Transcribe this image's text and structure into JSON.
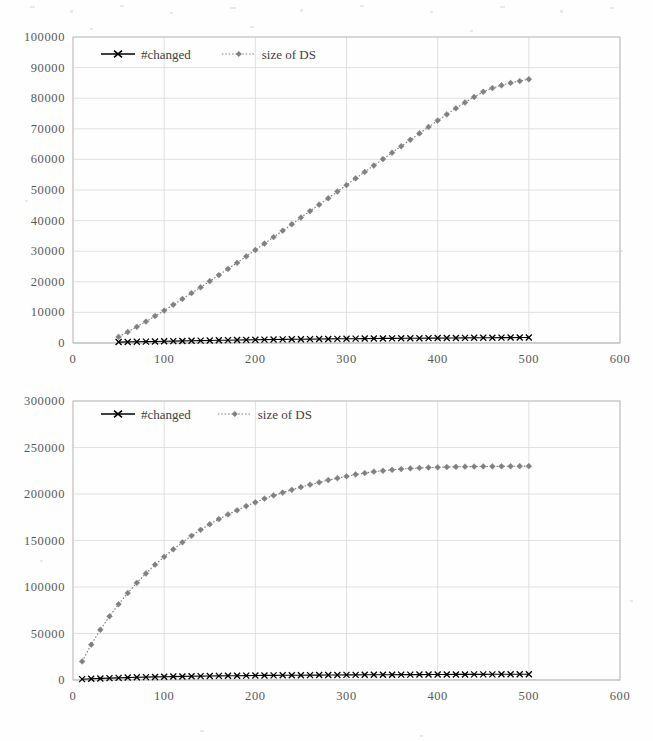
{
  "page": {
    "background_color": "#fefefe",
    "width": 653,
    "height": 741
  },
  "style": {
    "grid_color": "#d9d9d9",
    "axis_color": "#bfbfbf",
    "tick_label_color": "#595959",
    "changed_color": "#000000",
    "ds_color": "#808080"
  },
  "charts": [
    {
      "id": "chart-top",
      "legend": {
        "entries": [
          {
            "label": "#changed",
            "marker": "x-marker",
            "line": "solid",
            "color": "#000000"
          },
          {
            "label": "size of DS",
            "marker": "diamond-marker",
            "line": "dotted",
            "color": "#808080"
          }
        ]
      },
      "xlabel": "",
      "ylabel": "",
      "xticks": [
        "0",
        "100",
        "200",
        "300",
        "400",
        "500",
        "600"
      ],
      "yticks": [
        "0",
        "10000",
        "20000",
        "30000",
        "40000",
        "50000",
        "60000",
        "70000",
        "80000",
        "90000",
        "100000"
      ]
    },
    {
      "id": "chart-bot",
      "legend": {
        "entries": [
          {
            "label": "#changed",
            "marker": "x-marker",
            "line": "solid",
            "color": "#000000"
          },
          {
            "label": "size of DS",
            "marker": "diamond-marker",
            "line": "dotted",
            "color": "#808080"
          }
        ]
      },
      "xlabel": "",
      "ylabel": "",
      "xticks": [
        "0",
        "100",
        "200",
        "300",
        "400",
        "500",
        "600"
      ],
      "yticks": [
        "0",
        "50000",
        "100000",
        "150000",
        "200000",
        "250000",
        "300000"
      ]
    }
  ],
  "chart_data": [
    {
      "type": "line",
      "title": "",
      "xlabel": "",
      "ylabel": "",
      "xlim": [
        0,
        600
      ],
      "ylim": [
        0,
        100000
      ],
      "xticks": [
        0,
        100,
        200,
        300,
        400,
        500,
        600
      ],
      "yticks": [
        0,
        10000,
        20000,
        30000,
        40000,
        50000,
        60000,
        70000,
        80000,
        90000,
        100000
      ],
      "grid": true,
      "legend_position": "top-left-inside",
      "x": [
        50,
        60,
        70,
        80,
        90,
        100,
        110,
        120,
        130,
        140,
        150,
        160,
        170,
        180,
        190,
        200,
        210,
        220,
        230,
        240,
        250,
        260,
        270,
        280,
        290,
        300,
        310,
        320,
        330,
        340,
        350,
        360,
        370,
        380,
        390,
        400,
        410,
        420,
        430,
        440,
        450,
        460,
        470,
        480,
        490,
        500
      ],
      "series": [
        {
          "name": "#changed",
          "marker": "x",
          "linestyle": "solid",
          "color": "#000000",
          "values": [
            300,
            350,
            400,
            450,
            500,
            560,
            620,
            680,
            730,
            780,
            830,
            880,
            930,
            980,
            1020,
            1060,
            1100,
            1140,
            1180,
            1210,
            1240,
            1270,
            1300,
            1330,
            1360,
            1390,
            1420,
            1450,
            1470,
            1490,
            1510,
            1530,
            1550,
            1570,
            1590,
            1610,
            1630,
            1650,
            1670,
            1690,
            1710,
            1730,
            1750,
            1770,
            1790,
            1810
          ]
        },
        {
          "name": "size of DS",
          "marker": "diamond",
          "linestyle": "dotted",
          "color": "#808080",
          "values": [
            2000,
            3600,
            5300,
            7000,
            8800,
            10600,
            12500,
            14400,
            16300,
            18200,
            20200,
            22200,
            24200,
            26200,
            28300,
            30400,
            32500,
            34600,
            36700,
            38800,
            41000,
            43100,
            45200,
            47300,
            49500,
            51600,
            53800,
            55900,
            58000,
            60100,
            62200,
            64300,
            66400,
            68500,
            70600,
            72700,
            74700,
            76700,
            78600,
            80400,
            82100,
            83300,
            84200,
            85000,
            85600,
            86200
          ]
        }
      ]
    },
    {
      "type": "line",
      "title": "",
      "xlabel": "",
      "ylabel": "",
      "xlim": [
        0,
        600
      ],
      "ylim": [
        0,
        300000
      ],
      "xticks": [
        0,
        100,
        200,
        300,
        400,
        500,
        600
      ],
      "yticks": [
        0,
        50000,
        100000,
        150000,
        200000,
        250000,
        300000
      ],
      "grid": true,
      "legend_position": "top-left-inside",
      "x": [
        10,
        20,
        30,
        40,
        50,
        60,
        70,
        80,
        90,
        100,
        110,
        120,
        130,
        140,
        150,
        160,
        170,
        180,
        190,
        200,
        210,
        220,
        230,
        240,
        250,
        260,
        270,
        280,
        290,
        300,
        310,
        320,
        330,
        340,
        350,
        360,
        370,
        380,
        390,
        400,
        410,
        420,
        430,
        440,
        450,
        460,
        470,
        480,
        490,
        500
      ],
      "series": [
        {
          "name": "#changed",
          "marker": "x",
          "linestyle": "solid",
          "color": "#000000",
          "values": [
            900,
            1300,
            1700,
            2000,
            2300,
            2600,
            2900,
            3100,
            3300,
            3500,
            3700,
            3850,
            4000,
            4150,
            4300,
            4400,
            4500,
            4600,
            4700,
            4800,
            4900,
            4980,
            5050,
            5120,
            5190,
            5250,
            5310,
            5370,
            5430,
            5480,
            5530,
            5580,
            5630,
            5680,
            5720,
            5760,
            5800,
            5840,
            5880,
            5910,
            5940,
            5970,
            6000,
            6030,
            6060,
            6090,
            6120,
            6150,
            6180,
            6200
          ]
        },
        {
          "name": "size of DS",
          "marker": "diamond",
          "linestyle": "dotted",
          "color": "#808080",
          "values": [
            20000,
            38000,
            54000,
            68500,
            81500,
            93500,
            104500,
            114500,
            124000,
            132500,
            140500,
            148000,
            155000,
            161500,
            167500,
            173000,
            178000,
            182500,
            187000,
            191000,
            195000,
            198500,
            201500,
            204500,
            207500,
            210000,
            212500,
            215000,
            217000,
            219000,
            221000,
            222500,
            224000,
            225000,
            226000,
            226800,
            227500,
            228000,
            228400,
            228700,
            229000,
            229200,
            229400,
            229500,
            229600,
            229700,
            229800,
            229850,
            229900,
            229950
          ]
        }
      ]
    }
  ]
}
